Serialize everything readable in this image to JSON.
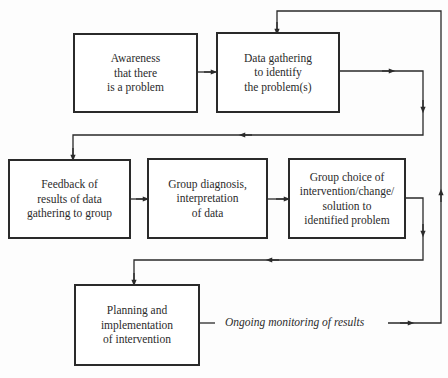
{
  "diagram": {
    "type": "flowchart",
    "boxes": [
      {
        "id": "awareness",
        "label": "Awareness\nthat there\nis a problem"
      },
      {
        "id": "data-gathering",
        "label": "Data gathering\nto identify\nthe problem(s)"
      },
      {
        "id": "feedback",
        "label": "Feedback of\nresults of data\ngathering to group"
      },
      {
        "id": "group-diagnosis",
        "label": "Group diagnosis,\ninterpretation\nof data"
      },
      {
        "id": "group-choice",
        "label": "Group choice of\nintervention/change/\nsolution to\nidentified problem"
      },
      {
        "id": "planning",
        "label": "Planning and\nimplementation\nof intervention"
      }
    ],
    "edges": [
      {
        "from": "awareness",
        "to": "data-gathering"
      },
      {
        "from": "data-gathering",
        "to": "feedback"
      },
      {
        "from": "feedback",
        "to": "group-diagnosis"
      },
      {
        "from": "group-diagnosis",
        "to": "group-choice"
      },
      {
        "from": "group-choice",
        "to": "planning"
      },
      {
        "from": "planning",
        "to": "data-gathering",
        "label": "Ongoing monitoring of results"
      }
    ],
    "annotation": "Ongoing monitoring of results",
    "colors": {
      "line": "#2a2a2a",
      "background": "#fdfdfd",
      "text": "#2b2b2b"
    }
  }
}
